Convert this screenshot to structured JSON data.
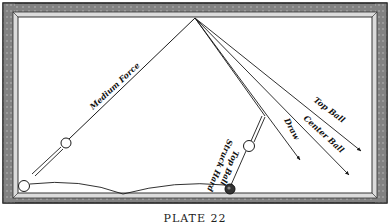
{
  "figure": {
    "caption": "PLATE 22"
  },
  "labels": {
    "medium_force": "Medium Force",
    "top_ball_struck_hard_line1": "Top Ball",
    "top_ball_struck_hard_line2": "Struck Hard",
    "draw": "Draw",
    "center_ball": "Center Ball",
    "top_ball": "Top Ball"
  },
  "colors": {
    "ink": "#1a1a1a",
    "frame_dark": "#3a3a3a",
    "frame_mid": "#8a8a8a",
    "paper": "#ffffff"
  }
}
